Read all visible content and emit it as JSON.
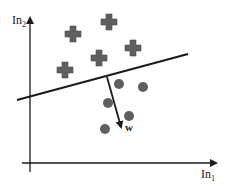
{
  "diagram": {
    "title": "",
    "axes": {
      "x_label": "In",
      "x_sub": "1",
      "y_label": "In",
      "y_sub": "2"
    },
    "decision_boundary": {
      "x1": 17,
      "y1": 100,
      "x2": 188,
      "y2": 54
    },
    "weight_vector": {
      "label": "w",
      "x1": 107,
      "y1": 77,
      "x2": 121,
      "y2": 127
    },
    "class_crosses": [
      {
        "x": 73,
        "y": 34
      },
      {
        "x": 109,
        "y": 22
      },
      {
        "x": 133,
        "y": 48
      },
      {
        "x": 99,
        "y": 58
      },
      {
        "x": 65,
        "y": 70
      }
    ],
    "class_circles": [
      {
        "x": 119,
        "y": 84
      },
      {
        "x": 143,
        "y": 87
      },
      {
        "x": 108,
        "y": 103
      },
      {
        "x": 129,
        "y": 116
      },
      {
        "x": 105,
        "y": 129
      }
    ],
    "colors": {
      "marker": "#5f5f5f",
      "line": "#1a1a1a",
      "background": "#ffffff"
    }
  }
}
